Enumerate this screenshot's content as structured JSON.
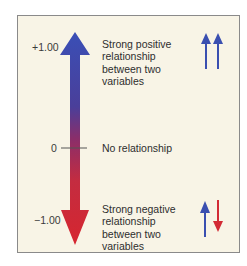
{
  "scale": {
    "top_value": "+1.00",
    "middle_value": "0",
    "bottom_value": "−1.00"
  },
  "descriptions": {
    "positive": "Strong positive relationship between two variables",
    "none": "No relationship",
    "negative": "Strong negative relationship between two variables"
  },
  "icons": {
    "positive": "two-up-arrows-icon",
    "negative": "up-and-down-arrows-icon"
  },
  "colors": {
    "positive": "#3a4fb0",
    "negative": "#d22b35",
    "panel_background": "#f8f4e6"
  }
}
